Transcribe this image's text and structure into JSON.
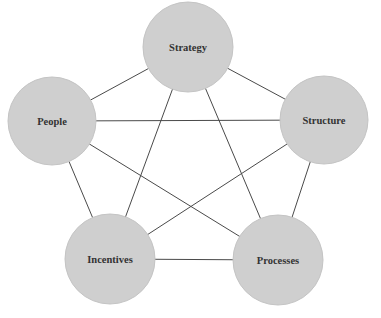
{
  "diagram": {
    "type": "network",
    "colors": {
      "node_fill": "#cfcfcf",
      "edge": "#4a4a4a",
      "text": "#333333",
      "background": "#ffffff"
    },
    "nodes": [
      {
        "id": "strategy",
        "label": "Strategy",
        "cx": 188,
        "cy": 47,
        "r": 45
      },
      {
        "id": "people",
        "label": "People",
        "cx": 52,
        "cy": 121,
        "r": 44
      },
      {
        "id": "structure",
        "label": "Structure",
        "cx": 324,
        "cy": 120,
        "r": 44
      },
      {
        "id": "incentives",
        "label": "Incentives",
        "cx": 110,
        "cy": 259,
        "r": 45
      },
      {
        "id": "processes",
        "label": "Processes",
        "cx": 278,
        "cy": 260,
        "r": 45
      }
    ],
    "edges": [
      {
        "from": "strategy",
        "to": "people"
      },
      {
        "from": "strategy",
        "to": "structure"
      },
      {
        "from": "strategy",
        "to": "incentives"
      },
      {
        "from": "strategy",
        "to": "processes"
      },
      {
        "from": "people",
        "to": "structure"
      },
      {
        "from": "people",
        "to": "incentives"
      },
      {
        "from": "people",
        "to": "processes"
      },
      {
        "from": "structure",
        "to": "incentives"
      },
      {
        "from": "structure",
        "to": "processes"
      },
      {
        "from": "incentives",
        "to": "processes"
      }
    ]
  }
}
